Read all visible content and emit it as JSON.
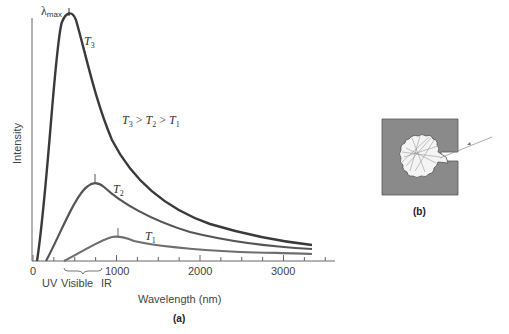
{
  "chart_data": {
    "type": "line",
    "title": "",
    "xlabel": "Wavelength (nm)",
    "ylabel": "Intensity",
    "xlim": [
      0,
      3600
    ],
    "ylim": [
      0,
      1
    ],
    "x_ticks": [
      0,
      1000,
      2000,
      3000
    ],
    "x_minor_step": 250,
    "grid": false,
    "legend": null,
    "annotations": {
      "peak_marker": "λmax",
      "relation": "T3 > T2 > T1",
      "regions": [
        "UV",
        "Visible",
        "IR"
      ]
    },
    "series": [
      {
        "name": "T3",
        "peak_wavelength_nm": 440,
        "peak_intensity": 1.0,
        "x": [
          50,
          200,
          300,
          400,
          440,
          500,
          600,
          800,
          1000,
          1500,
          2000,
          2500,
          3000,
          3400
        ],
        "values": [
          0.0,
          0.45,
          0.82,
          0.98,
          1.0,
          0.97,
          0.85,
          0.58,
          0.42,
          0.24,
          0.15,
          0.1,
          0.075,
          0.065
        ]
      },
      {
        "name": "T2",
        "peak_wavelength_nm": 740,
        "peak_intensity": 0.32,
        "x": [
          150,
          300,
          500,
          700,
          740,
          900,
          1200,
          1500,
          2000,
          2500,
          3000,
          3400
        ],
        "values": [
          0.0,
          0.08,
          0.22,
          0.31,
          0.32,
          0.29,
          0.22,
          0.16,
          0.11,
          0.08,
          0.06,
          0.05
        ]
      },
      {
        "name": "T1",
        "peak_wavelength_nm": 1000,
        "peak_intensity": 0.1,
        "x": [
          370,
          600,
          800,
          1000,
          1200,
          1500,
          2000,
          2500,
          3000,
          3400
        ],
        "values": [
          0.0,
          0.05,
          0.085,
          0.1,
          0.095,
          0.08,
          0.055,
          0.04,
          0.03,
          0.02
        ]
      }
    ]
  },
  "labels": {
    "lambda_max": "λ",
    "lambda_max_sub": "max",
    "t3": "T",
    "t3_sub": "3",
    "t2": "T",
    "t2_sub": "2",
    "t1": "T",
    "t1_sub": "1",
    "relation_parts": [
      "T",
      "3",
      " > ",
      "T",
      "2",
      " > ",
      "T",
      "1"
    ],
    "y_axis": "Intensity",
    "x_axis": "Wavelength (nm)",
    "tick_0": "0",
    "tick_1000": "1000",
    "tick_2000": "2000",
    "tick_3000": "3000",
    "uv": "UV",
    "visible": "Visible",
    "ir": "IR",
    "panel_a": "(a)",
    "panel_b": "(b)"
  },
  "colors": {
    "t3_curve": "#3a3a3a",
    "t2_curve": "#555555",
    "t1_curve": "#6e6e6e",
    "axis": "#666666",
    "cavity_body": "#8a8a8a"
  }
}
